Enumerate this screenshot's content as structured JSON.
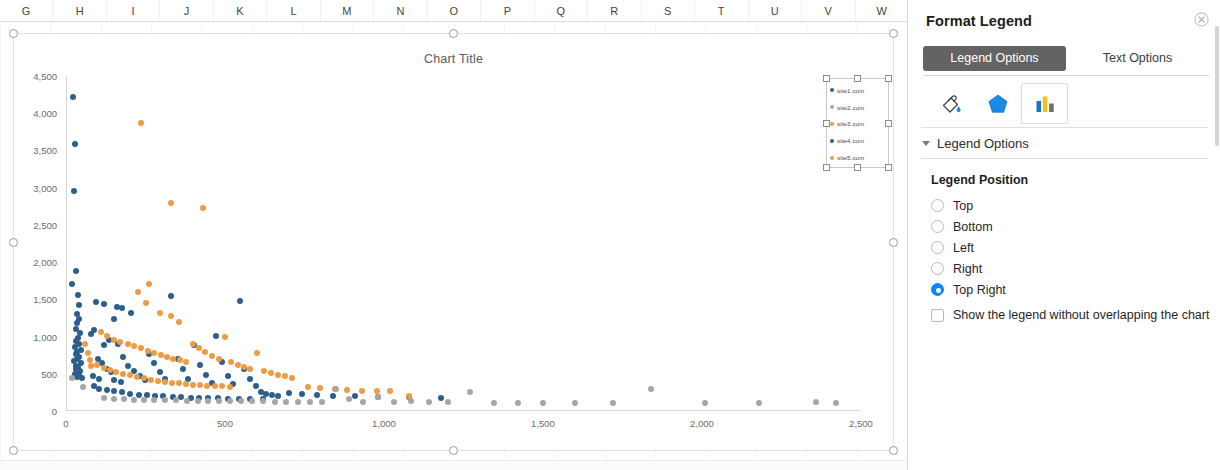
{
  "spreadsheet": {
    "column_headers": [
      "G",
      "H",
      "I",
      "J",
      "K",
      "L",
      "M",
      "N",
      "O",
      "P",
      "Q",
      "R",
      "S",
      "T",
      "U",
      "V",
      "W"
    ]
  },
  "chart": {
    "title": "Chart Title",
    "legend": {
      "selected": true,
      "items": [
        {
          "label": "site1.com",
          "color": "#2d5f8e"
        },
        {
          "label": "site2.com",
          "color": "#a6a6a6"
        },
        {
          "label": "site3.com",
          "color": "#ed9c45"
        },
        {
          "label": "site4.com",
          "color": "#2d5f8e"
        },
        {
          "label": "site5.com",
          "color": "#ed9c45"
        }
      ]
    }
  },
  "chart_data": {
    "type": "scatter",
    "title": "Chart Title",
    "xlabel": "",
    "ylabel": "",
    "xlim": [
      0,
      2500
    ],
    "ylim": [
      0,
      4500
    ],
    "xticks": [
      "0",
      "500",
      "1,000",
      "1,500",
      "2,000",
      "2,500"
    ],
    "yticks": [
      "0",
      "500",
      "1,000",
      "1,500",
      "2,000",
      "2,500",
      "3,000",
      "3,500",
      "4,000",
      "4,500"
    ],
    "xtick_values": [
      0,
      500,
      1000,
      1500,
      2000,
      2500
    ],
    "ytick_values": [
      0,
      500,
      1000,
      1500,
      2000,
      2500,
      3000,
      3500,
      4000,
      4500
    ],
    "grid": false,
    "legend_position": "top right",
    "series": [
      {
        "name": "site1.com",
        "color": "#2d5f8e",
        "points": [
          [
            22,
            4220
          ],
          [
            28,
            3580
          ],
          [
            25,
            2960
          ],
          [
            30,
            1880
          ],
          [
            20,
            1700
          ],
          [
            38,
            1560
          ],
          [
            40,
            1420
          ],
          [
            36,
            1300
          ],
          [
            42,
            1230
          ],
          [
            35,
            1180
          ],
          [
            30,
            1100
          ],
          [
            44,
            1050
          ],
          [
            38,
            980
          ],
          [
            32,
            940
          ],
          [
            40,
            900
          ],
          [
            28,
            860
          ],
          [
            46,
            820
          ],
          [
            34,
            790
          ],
          [
            30,
            760
          ],
          [
            42,
            730
          ],
          [
            36,
            700
          ],
          [
            26,
            670
          ],
          [
            48,
            640
          ],
          [
            32,
            610
          ],
          [
            38,
            590
          ],
          [
            30,
            560
          ],
          [
            44,
            540
          ],
          [
            34,
            520
          ],
          [
            28,
            500
          ],
          [
            40,
            480
          ],
          [
            36,
            460
          ],
          [
            50,
            440
          ],
          [
            95,
            1460
          ],
          [
            120,
            1440
          ],
          [
            160,
            1400
          ],
          [
            175,
            1380
          ],
          [
            150,
            1240
          ],
          [
            88,
            1090
          ],
          [
            78,
            1030
          ],
          [
            205,
            1320
          ],
          [
            118,
            880
          ],
          [
            135,
            960
          ],
          [
            165,
            905
          ],
          [
            180,
            720
          ],
          [
            100,
            700
          ],
          [
            112,
            640
          ],
          [
            128,
            560
          ],
          [
            142,
            520
          ],
          [
            86,
            470
          ],
          [
            104,
            430
          ],
          [
            152,
            420
          ],
          [
            172,
            390
          ],
          [
            196,
            600
          ],
          [
            215,
            540
          ],
          [
            232,
            470
          ],
          [
            248,
            420
          ],
          [
            262,
            760
          ],
          [
            278,
            640
          ],
          [
            296,
            520
          ],
          [
            310,
            430
          ],
          [
            330,
            1540
          ],
          [
            352,
            700
          ],
          [
            368,
            560
          ],
          [
            385,
            430
          ],
          [
            404,
            880
          ],
          [
            422,
            620
          ],
          [
            440,
            490
          ],
          [
            458,
            370
          ],
          [
            472,
            1010
          ],
          [
            490,
            660
          ],
          [
            508,
            470
          ],
          [
            524,
            360
          ],
          [
            546,
            1480
          ],
          [
            560,
            560
          ],
          [
            578,
            430
          ],
          [
            596,
            340
          ],
          [
            612,
            250
          ],
          [
            630,
            230
          ],
          [
            648,
            215
          ],
          [
            666,
            205
          ],
          [
            700,
            240
          ],
          [
            742,
            230
          ],
          [
            790,
            215
          ],
          [
            840,
            205
          ],
          [
            910,
            195
          ],
          [
            980,
            190
          ],
          [
            1080,
            185
          ],
          [
            1180,
            180
          ],
          [
            88,
            330
          ],
          [
            105,
            300
          ],
          [
            130,
            285
          ],
          [
            150,
            270
          ],
          [
            175,
            250
          ],
          [
            200,
            235
          ],
          [
            230,
            220
          ],
          [
            255,
            210
          ],
          [
            280,
            200
          ],
          [
            305,
            195
          ],
          [
            335,
            190
          ],
          [
            362,
            185
          ],
          [
            392,
            180
          ],
          [
            418,
            175
          ],
          [
            448,
            170
          ],
          [
            478,
            168
          ],
          [
            510,
            165
          ],
          [
            545,
            162
          ],
          [
            580,
            160
          ],
          [
            618,
            158
          ]
        ]
      },
      {
        "name": "site3.com",
        "color": "#ed9c45",
        "points": [
          [
            237,
            3870
          ],
          [
            330,
            2790
          ],
          [
            430,
            2730
          ],
          [
            262,
            1700
          ],
          [
            225,
            1600
          ],
          [
            250,
            1450
          ],
          [
            295,
            1320
          ],
          [
            330,
            1280
          ],
          [
            355,
            1200
          ],
          [
            110,
            1060
          ],
          [
            130,
            1010
          ],
          [
            150,
            960
          ],
          [
            170,
            930
          ],
          [
            195,
            900
          ],
          [
            215,
            870
          ],
          [
            235,
            840
          ],
          [
            258,
            810
          ],
          [
            278,
            780
          ],
          [
            298,
            750
          ],
          [
            318,
            720
          ],
          [
            338,
            700
          ],
          [
            358,
            680
          ],
          [
            378,
            660
          ],
          [
            398,
            900
          ],
          [
            418,
            840
          ],
          [
            438,
            790
          ],
          [
            460,
            740
          ],
          [
            480,
            700
          ],
          [
            500,
            1000
          ],
          [
            520,
            660
          ],
          [
            540,
            620
          ],
          [
            560,
            590
          ],
          [
            580,
            560
          ],
          [
            600,
            780
          ],
          [
            622,
            540
          ],
          [
            645,
            510
          ],
          [
            668,
            490
          ],
          [
            690,
            470
          ],
          [
            712,
            450
          ],
          [
            98,
            620
          ],
          [
            118,
            580
          ],
          [
            138,
            550
          ],
          [
            158,
            520
          ],
          [
            178,
            500
          ],
          [
            200,
            480
          ],
          [
            222,
            460
          ],
          [
            244,
            440
          ],
          [
            266,
            420
          ],
          [
            288,
            405
          ],
          [
            310,
            390
          ],
          [
            332,
            380
          ],
          [
            354,
            370
          ],
          [
            376,
            360
          ],
          [
            398,
            350
          ],
          [
            420,
            345
          ],
          [
            444,
            340
          ],
          [
            468,
            335
          ],
          [
            492,
            330
          ],
          [
            516,
            325
          ],
          [
            60,
            900
          ],
          [
            68,
            780
          ],
          [
            74,
            690
          ],
          [
            80,
            600
          ],
          [
            760,
            320
          ],
          [
            800,
            305
          ],
          [
            845,
            295
          ],
          [
            885,
            285
          ],
          [
            930,
            275
          ],
          [
            978,
            268
          ],
          [
            1020,
            262
          ],
          [
            1080,
            205
          ]
        ]
      },
      {
        "name": "site2.com",
        "color": "#a6a6a6",
        "points": [
          [
            18,
            440
          ],
          [
            52,
            320
          ],
          [
            120,
            170
          ],
          [
            150,
            160
          ],
          [
            182,
            155
          ],
          [
            214,
            150
          ],
          [
            246,
            148
          ],
          [
            278,
            145
          ],
          [
            312,
            143
          ],
          [
            345,
            142
          ],
          [
            380,
            140
          ],
          [
            415,
            138
          ],
          [
            448,
            136
          ],
          [
            482,
            135
          ],
          [
            515,
            133
          ],
          [
            550,
            132
          ],
          [
            585,
            130
          ],
          [
            620,
            128
          ],
          [
            656,
            127
          ],
          [
            692,
            126
          ],
          [
            730,
            125
          ],
          [
            768,
            124
          ],
          [
            806,
            122
          ],
          [
            848,
            300
          ],
          [
            890,
            155
          ],
          [
            935,
            120
          ],
          [
            980,
            190
          ],
          [
            1030,
            118
          ],
          [
            1085,
            135
          ],
          [
            1140,
            116
          ],
          [
            1200,
            115
          ],
          [
            1270,
            250
          ],
          [
            1345,
            113
          ],
          [
            1420,
            112
          ],
          [
            1500,
            110
          ],
          [
            1600,
            108
          ],
          [
            1720,
            107
          ],
          [
            1840,
            300
          ],
          [
            2010,
            104
          ],
          [
            2180,
            102
          ],
          [
            2360,
            120
          ],
          [
            2420,
            101
          ]
        ]
      }
    ]
  },
  "pane": {
    "title": "Format Legend",
    "close_icon": "close-circle-icon",
    "tabs": [
      {
        "label": "Legend Options",
        "active": true
      },
      {
        "label": "Text Options",
        "active": false
      }
    ],
    "format_icons": [
      {
        "name": "fill-and-line-icon",
        "selected": false
      },
      {
        "name": "effects-icon",
        "selected": false
      },
      {
        "name": "size-and-properties-icon",
        "selected": true
      }
    ],
    "section": {
      "title": "Legend Options",
      "expanded": true
    },
    "legend_position": {
      "heading": "Legend Position",
      "options": [
        {
          "label": "Top",
          "selected": false
        },
        {
          "label": "Bottom",
          "selected": false
        },
        {
          "label": "Left",
          "selected": false
        },
        {
          "label": "Right",
          "selected": false
        },
        {
          "label": "Top Right",
          "selected": true
        }
      ],
      "checkbox": {
        "label": "Show the legend without overlapping the chart",
        "checked": false
      }
    },
    "accent_color": "#0a84ff"
  }
}
